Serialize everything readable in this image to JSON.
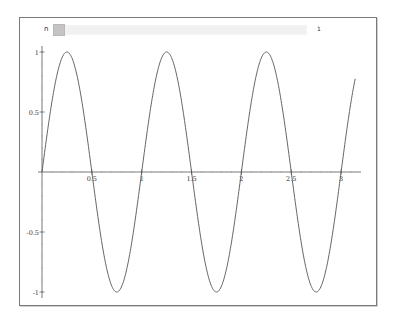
{
  "slider": {
    "label": "n",
    "value": "1",
    "position": 0
  },
  "colors": {
    "curve": "#555555",
    "axis": "#555555",
    "frame": "#7a7a7a"
  },
  "chart_data": {
    "type": "line",
    "title": "",
    "xlabel": "",
    "ylabel": "",
    "function": "sin(2*pi*n*x)",
    "xlim": [
      0,
      3.14159
    ],
    "ylim": [
      -1,
      1
    ],
    "grid": false,
    "legend": null,
    "x_ticks": [
      {
        "value": 0.5,
        "label": "0.5"
      },
      {
        "value": 1,
        "label": "1"
      },
      {
        "value": 1.5,
        "label": "1.5"
      },
      {
        "value": 2,
        "label": "2"
      },
      {
        "value": 2.5,
        "label": "2.5"
      },
      {
        "value": 3,
        "label": "3"
      }
    ],
    "y_ticks": [
      {
        "value": 1,
        "label": "1"
      },
      {
        "value": 0.5,
        "label": "0.5"
      },
      {
        "value": -0.5,
        "label": "-0.5"
      },
      {
        "value": -1,
        "label": "-1"
      }
    ],
    "series": [
      {
        "name": "sin(2πx)",
        "x": [
          0,
          0.25,
          0.5,
          0.75,
          1,
          1.25,
          1.5,
          1.75,
          2,
          2.25,
          2.5,
          2.75,
          3,
          3.14
        ],
        "values": [
          0,
          1,
          0,
          -1,
          0,
          1,
          0,
          -1,
          0,
          1,
          0,
          -1,
          0,
          0.77
        ]
      }
    ]
  }
}
